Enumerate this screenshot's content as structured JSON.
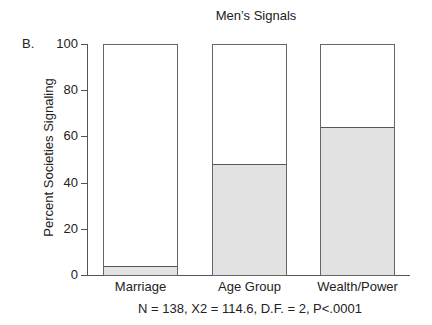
{
  "chart_data": {
    "type": "bar",
    "title": "Men’s Signals",
    "panel_label": "B.",
    "categories": [
      "Marriage",
      "Age Group",
      "Wealth/Power"
    ],
    "values": [
      4,
      48,
      64
    ],
    "xlabel": "",
    "ylabel": "Percent Societies Signaling",
    "ylim": [
      0,
      100
    ],
    "yticks": [
      0,
      20,
      40,
      60,
      80,
      100
    ],
    "grid": false,
    "stacked_outline_to": 100,
    "fill_color": "#e2e2e2",
    "footnote": "N = 138, X2 = 114.6, D.F. = 2, P<.0001"
  },
  "labels": {
    "title": "Men’s Signals",
    "panel": "B.",
    "ylabel": "Percent Societies Signaling",
    "yticks": [
      "0",
      "20",
      "40",
      "60",
      "80",
      "100"
    ],
    "categories": [
      "Marriage",
      "Age Group",
      "Wealth/Power"
    ],
    "footnote": "N = 138, X2 = 114.6, D.F. = 2, P<.0001"
  }
}
